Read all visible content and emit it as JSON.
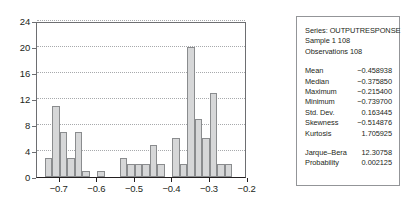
{
  "chart_data": {
    "type": "bar",
    "title": "",
    "xlabel": "",
    "ylabel": "",
    "xlim": [
      -0.7605,
      -0.2015
    ],
    "ylim": [
      0,
      24
    ],
    "grid": true,
    "y_ticks": [
      0,
      4,
      8,
      12,
      16,
      20,
      24
    ],
    "x_ticks": [
      -0.7,
      -0.6,
      -0.5,
      -0.4,
      -0.3,
      -0.2
    ],
    "x_tick_labels": [
      "−0.7",
      "−0.6",
      "−0.5",
      "−0.4",
      "−0.3",
      "−0.2"
    ],
    "y_tick_labels": [
      "0",
      "4",
      "8",
      "12",
      "16",
      "20",
      "24"
    ],
    "bin_width": 0.02,
    "bin_starts": [
      -0.7405,
      -0.7205,
      -0.7005,
      -0.6805,
      -0.6605,
      -0.6405,
      -0.6205,
      -0.6005,
      -0.5405,
      -0.5205,
      -0.5005,
      -0.4805,
      -0.4605,
      -0.4405,
      -0.4205,
      -0.4005,
      -0.3805,
      -0.3605,
      -0.3405,
      -0.3205,
      -0.3005,
      -0.2805,
      -0.2605,
      -0.2405,
      -0.2205
    ],
    "categories": [
      "-0.74",
      "-0.72",
      "-0.70",
      "-0.68",
      "-0.66",
      "-0.64",
      "-0.62",
      "-0.60",
      "-0.54",
      "-0.52",
      "-0.50",
      "-0.48",
      "-0.46",
      "-0.44",
      "-0.42",
      "-0.40",
      "-0.38",
      "-0.36",
      "-0.34",
      "-0.32",
      "-0.30",
      "-0.28",
      "-0.26",
      "-0.24",
      "-0.22"
    ],
    "values": [
      3,
      11,
      7,
      3,
      7,
      1,
      0,
      1,
      3,
      2,
      2,
      2,
      5,
      2,
      0,
      6,
      2,
      20,
      9,
      6,
      13,
      2,
      2,
      0,
      0
    ],
    "bar_color": "#d6d7d8",
    "bar_edge_color": "#8a8c8e"
  },
  "stats": {
    "header": {
      "series": "Series: OUTPUTRESPONSE",
      "sample": "Sample 1 108",
      "observations": "Observations 108"
    },
    "rows": [
      {
        "key": "Mean",
        "value": "−0.458938"
      },
      {
        "key": "Median",
        "value": "−0.375850"
      },
      {
        "key": "Maximum",
        "value": "−0.215400"
      },
      {
        "key": "Minimum",
        "value": "−0.739700"
      },
      {
        "key": "Std. Dev.",
        "value": "0.163445"
      },
      {
        "key": "Skewness",
        "value": "−0.514876"
      },
      {
        "key": "Kurtosis",
        "value": "1.705925"
      }
    ],
    "tests": [
      {
        "key": "Jarque–Bera",
        "value": "12.30758"
      },
      {
        "key": "Probability",
        "value": "0.002125"
      }
    ]
  }
}
